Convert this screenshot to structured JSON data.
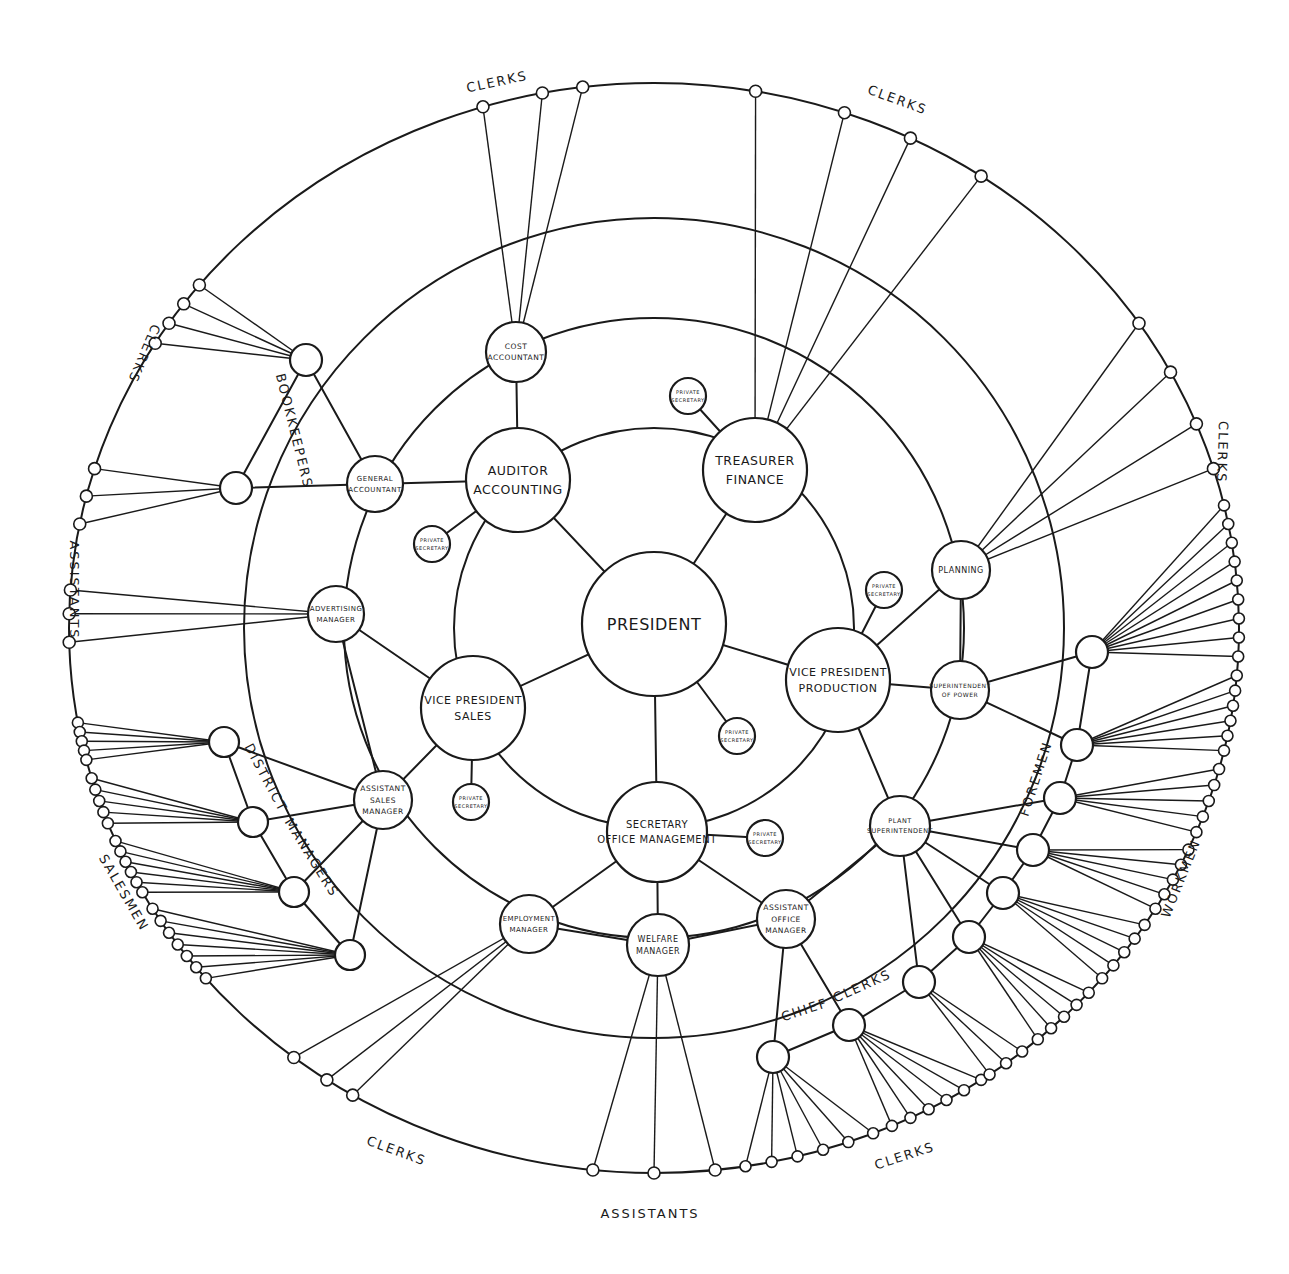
{
  "diagram": {
    "type": "circular-organization-chart",
    "center": {
      "x": 654,
      "y": 624
    },
    "rings": [
      {
        "name": "ring-executives",
        "r": 200
      },
      {
        "name": "ring-managers",
        "r": 310
      },
      {
        "name": "ring-subordinates",
        "r": 410
      },
      {
        "name": "ring-staff",
        "r": 545
      }
    ],
    "nodes": [
      {
        "id": "president",
        "lines": [
          "PRESIDENT"
        ],
        "x": 654,
        "y": 624,
        "r": 72,
        "fs": 16
      },
      {
        "id": "auditor",
        "lines": [
          "AUDITOR",
          "ACCOUNTING"
        ],
        "x": 518,
        "y": 480,
        "r": 52,
        "fs": 12.5
      },
      {
        "id": "treasurer",
        "lines": [
          "TREASURER",
          "FINANCE"
        ],
        "x": 755,
        "y": 470,
        "r": 52,
        "fs": 12.5
      },
      {
        "id": "vp-production",
        "lines": [
          "VICE PRESIDENT",
          "PRODUCTION"
        ],
        "x": 838,
        "y": 680,
        "r": 52,
        "fs": 11
      },
      {
        "id": "vp-sales",
        "lines": [
          "VICE PRESIDENT",
          "SALES"
        ],
        "x": 473,
        "y": 708,
        "r": 52,
        "fs": 11
      },
      {
        "id": "secretary",
        "lines": [
          "SECRETARY",
          "OFFICE MANAGEMENT"
        ],
        "x": 657,
        "y": 832,
        "r": 50,
        "fs": 10
      },
      {
        "id": "cost-accountant",
        "lines": [
          "COST",
          "ACCOUNTANT"
        ],
        "x": 516,
        "y": 352,
        "r": 30,
        "fs": 7.5
      },
      {
        "id": "general-accountant",
        "lines": [
          "GENERAL",
          "ACCOUNTANT"
        ],
        "x": 375,
        "y": 484,
        "r": 28,
        "fs": 7
      },
      {
        "id": "advertising-manager",
        "lines": [
          "ADVERTISING",
          "MANAGER"
        ],
        "x": 336,
        "y": 614,
        "r": 28,
        "fs": 7
      },
      {
        "id": "assistant-sales-manager",
        "lines": [
          "ASSISTANT",
          "SALES",
          "MANAGER"
        ],
        "x": 383,
        "y": 800,
        "r": 29,
        "fs": 7.5
      },
      {
        "id": "employment-manager",
        "lines": [
          "EMPLOYMENT",
          "MANAGER"
        ],
        "x": 529,
        "y": 924,
        "r": 29,
        "fs": 7
      },
      {
        "id": "welfare-manager",
        "lines": [
          "WELFARE",
          "MANAGER"
        ],
        "x": 658,
        "y": 945,
        "r": 31,
        "fs": 8
      },
      {
        "id": "assistant-office-manager",
        "lines": [
          "ASSISTANT",
          "OFFICE",
          "MANAGER"
        ],
        "x": 786,
        "y": 919,
        "r": 29,
        "fs": 7.5
      },
      {
        "id": "plant-superintendent",
        "lines": [
          "PLANT",
          "SUPERINTENDENT"
        ],
        "x": 900,
        "y": 826,
        "r": 30,
        "fs": 6.5
      },
      {
        "id": "superintendent-power",
        "lines": [
          "SUPERINTENDENT",
          "OF POWER"
        ],
        "x": 960,
        "y": 690,
        "r": 29,
        "fs": 6
      },
      {
        "id": "planning",
        "lines": [
          "PLANNING"
        ],
        "x": 961,
        "y": 570,
        "r": 29,
        "fs": 8
      },
      {
        "id": "ps-auditor",
        "lines": [
          "PRIVATE",
          "SECRETARY"
        ],
        "x": 432,
        "y": 544,
        "r": 18,
        "fs": 5
      },
      {
        "id": "ps-treasurer",
        "lines": [
          "PRIVATE",
          "SECRETARY"
        ],
        "x": 688,
        "y": 396,
        "r": 18,
        "fs": 5
      },
      {
        "id": "ps-production",
        "lines": [
          "PRIVATE",
          "SECRETARY"
        ],
        "x": 884,
        "y": 590,
        "r": 18,
        "fs": 5
      },
      {
        "id": "ps-president",
        "lines": [
          "PRIVATE",
          "SECRETARY"
        ],
        "x": 737,
        "y": 736,
        "r": 18,
        "fs": 5
      },
      {
        "id": "ps-sales",
        "lines": [
          "PRIVATE",
          "SECRETARY"
        ],
        "x": 471,
        "y": 802,
        "r": 18,
        "fs": 5
      },
      {
        "id": "ps-secretary",
        "lines": [
          "PRIVATE",
          "SECRETARY"
        ],
        "x": 765,
        "y": 838,
        "r": 18,
        "fs": 5
      }
    ],
    "edges": [
      [
        "president",
        "auditor"
      ],
      [
        "president",
        "treasurer"
      ],
      [
        "president",
        "vp-production"
      ],
      [
        "president",
        "vp-sales"
      ],
      [
        "president",
        "secretary"
      ],
      [
        "president",
        "ps-president"
      ],
      [
        "auditor",
        "cost-accountant"
      ],
      [
        "auditor",
        "general-accountant"
      ],
      [
        "auditor",
        "ps-auditor"
      ],
      [
        "treasurer",
        "ps-treasurer"
      ],
      [
        "vp-production",
        "ps-production"
      ],
      [
        "vp-production",
        "planning"
      ],
      [
        "vp-production",
        "superintendent-power"
      ],
      [
        "vp-production",
        "plant-superintendent"
      ],
      [
        "planning",
        "superintendent-power"
      ],
      [
        "vp-sales",
        "advertising-manager"
      ],
      [
        "vp-sales",
        "assistant-sales-manager"
      ],
      [
        "vp-sales",
        "ps-sales"
      ],
      [
        "advertising-manager",
        "assistant-sales-manager"
      ],
      [
        "secretary",
        "employment-manager"
      ],
      [
        "secretary",
        "welfare-manager"
      ],
      [
        "secretary",
        "assistant-office-manager"
      ],
      [
        "secretary",
        "ps-secretary"
      ],
      [
        "employment-manager",
        "welfare-manager"
      ],
      [
        "welfare-manager",
        "assistant-office-manager"
      ],
      [
        "assistant-office-manager",
        "plant-superintendent"
      ]
    ],
    "group_labels": [
      {
        "text": "CLERKS",
        "x": 498,
        "y": 86,
        "rot": -12
      },
      {
        "text": "CLERKS",
        "x": 896,
        "y": 104,
        "rot": 20
      },
      {
        "text": "CLERKS",
        "x": 140,
        "y": 352,
        "rot": 113
      },
      {
        "text": "CLERKS",
        "x": 1218,
        "y": 452,
        "rot": 92
      },
      {
        "text": "BOOKKEEPERS",
        "x": 290,
        "y": 432,
        "rot": 76
      },
      {
        "text": "ASSISTANTS",
        "x": 70,
        "y": 590,
        "rot": 90
      },
      {
        "text": "DISTRICT",
        "x": 262,
        "y": 780,
        "rot": 62
      },
      {
        "text": "MANAGERS",
        "x": 308,
        "y": 860,
        "rot": 58
      },
      {
        "text": "SALESMEN",
        "x": 120,
        "y": 895,
        "rot": 60
      },
      {
        "text": "FOREMEN",
        "x": 1040,
        "y": 780,
        "rot": -72
      },
      {
        "text": "WORKMEN",
        "x": 1185,
        "y": 880,
        "rot": -68
      },
      {
        "text": "CHIEF",
        "x": 806,
        "y": 1014,
        "rot": -18
      },
      {
        "text": "CLERKS",
        "x": 864,
        "y": 990,
        "rot": -24
      },
      {
        "text": "CLERKS",
        "x": 395,
        "y": 1155,
        "rot": 20
      },
      {
        "text": "ASSISTANTS",
        "x": 650,
        "y": 1218,
        "rot": 0
      },
      {
        "text": "CLERKS",
        "x": 906,
        "y": 1160,
        "rot": -18
      }
    ]
  }
}
